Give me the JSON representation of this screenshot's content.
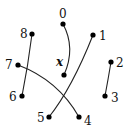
{
  "diagram": {
    "type": "matching",
    "nodes": [
      {
        "id": "0",
        "label": "0",
        "x": 63,
        "y": 24,
        "lx": 59,
        "ly": 18
      },
      {
        "id": "x",
        "label": "x",
        "x": 64,
        "y": 75,
        "lx": 56,
        "ly": 66
      },
      {
        "id": "8",
        "label": "8",
        "x": 32,
        "y": 34,
        "lx": 20,
        "ly": 38
      },
      {
        "id": "1",
        "label": "1",
        "x": 93,
        "y": 35,
        "lx": 99,
        "ly": 40
      },
      {
        "id": "7",
        "label": "7",
        "x": 18,
        "y": 65,
        "lx": 5,
        "ly": 69
      },
      {
        "id": "2",
        "label": "2",
        "x": 111,
        "y": 62,
        "lx": 116,
        "ly": 67
      },
      {
        "id": "6",
        "label": "6",
        "x": 22,
        "y": 96,
        "lx": 9,
        "ly": 101
      },
      {
        "id": "3",
        "label": "3",
        "x": 105,
        "y": 96,
        "lx": 111,
        "ly": 102
      },
      {
        "id": "5",
        "label": "5",
        "x": 49,
        "y": 117,
        "lx": 37,
        "ly": 122
      },
      {
        "id": "4",
        "label": "4",
        "x": 79,
        "y": 117,
        "lx": 84,
        "ly": 125
      }
    ],
    "edges": [
      {
        "from": "0",
        "to": "x"
      },
      {
        "from": "8",
        "to": "6"
      },
      {
        "from": "1",
        "to": "5"
      },
      {
        "from": "7",
        "to": "4"
      },
      {
        "from": "2",
        "to": "3"
      }
    ]
  }
}
